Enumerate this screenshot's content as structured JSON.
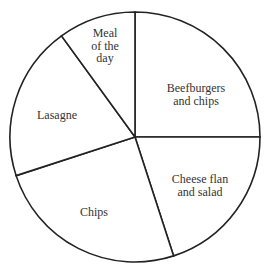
{
  "chart_data": {
    "type": "pie",
    "title": "",
    "start_angle_deg": 0,
    "direction": "clockwise",
    "categories": [
      "Beefburgers and chips",
      "Cheese flan and salad",
      "Chips",
      "Lasagne",
      "Meal of the day"
    ],
    "values": [
      25,
      20,
      25,
      20,
      10
    ],
    "angles_deg": [
      90,
      72,
      90,
      72,
      36
    ],
    "labels": [
      {
        "lines": [
          "Beefburgers",
          "and chips"
        ],
        "x": 196,
        "y": 92
      },
      {
        "lines": [
          "Cheese flan",
          "and salad"
        ],
        "x": 200,
        "y": 183
      },
      {
        "lines": [
          "Chips"
        ],
        "x": 94,
        "y": 216
      },
      {
        "lines": [
          "Lasagne"
        ],
        "x": 57,
        "y": 119
      },
      {
        "lines": [
          "Meal",
          "of the",
          "day"
        ],
        "x": 105,
        "y": 37
      }
    ],
    "legend": "none",
    "center": [
      135,
      137
    ],
    "radius": 125,
    "colors": {
      "fill": "#ffffff",
      "stroke": "#222222",
      "text": "#333333"
    }
  }
}
